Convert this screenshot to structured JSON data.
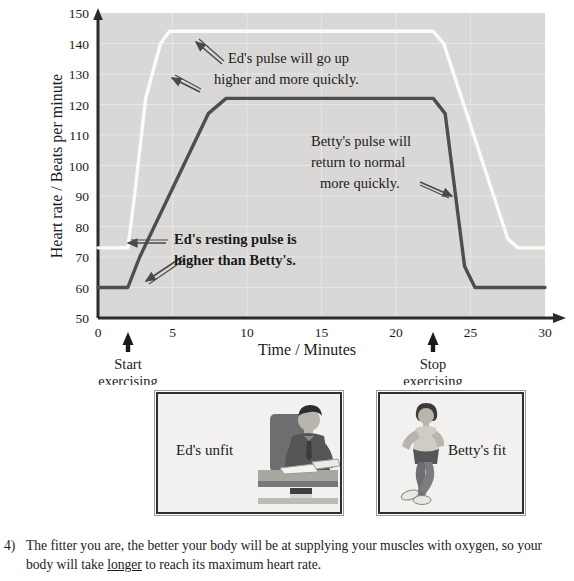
{
  "chart_data": {
    "type": "line",
    "title": "",
    "xlabel": "Time / Minutes",
    "ylabel": "Heart rate / Beats per minute",
    "xlim": [
      0,
      30
    ],
    "ylim": [
      50,
      150
    ],
    "x_ticks": [
      "0",
      "5",
      "10",
      "15",
      "20",
      "25",
      "30"
    ],
    "x_tick_values": [
      0,
      5,
      10,
      15,
      20,
      25,
      30
    ],
    "y_ticks": [
      "50",
      "60",
      "70",
      "80",
      "90",
      "100",
      "110",
      "120",
      "130",
      "140",
      "150"
    ],
    "y_tick_values": [
      50,
      60,
      70,
      80,
      90,
      100,
      110,
      120,
      130,
      140,
      150
    ],
    "grid": true,
    "legend_position": "none",
    "plot_background": "#d9d8d6",
    "series": [
      {
        "name": "Ed",
        "color": "#fbfbf9",
        "description": "Ed's pulse: resting 73, rises fast to peak 144, returns slowly",
        "x": [
          0,
          2,
          2.4,
          3.2,
          4.2,
          4.8,
          22.5,
          23.2,
          27.5,
          28.2,
          30
        ],
        "values": [
          73,
          73,
          88,
          122,
          140,
          144,
          144,
          140,
          76,
          73,
          73
        ]
      },
      {
        "name": "Betty",
        "color": "#4e4e52",
        "description": "Betty's pulse: resting 60, rises slowly to peak 122, returns quickly",
        "x": [
          0,
          2,
          2.8,
          7.4,
          8.6,
          22.5,
          23.3,
          24.6,
          25.3,
          30
        ],
        "values": [
          60,
          60,
          70,
          117,
          122,
          122,
          117,
          67,
          60,
          60
        ]
      }
    ],
    "markers": [
      {
        "name": "start-exercising",
        "x_value": 2,
        "label_line1": "Start",
        "label_line2": "exercising"
      },
      {
        "name": "stop-exercising",
        "x_value": 22.5,
        "label_line1": "Stop",
        "label_line2": "exercising"
      }
    ],
    "annotations": [
      {
        "name": "ed-pulse-annotation",
        "lines": [
          "Ed's pulse will go up",
          "higher and more quickly."
        ],
        "arrows": 2
      },
      {
        "name": "betty-pulse-annotation",
        "lines": [
          "Betty's pulse will",
          "return to normal",
          "more quickly."
        ],
        "arrows": 1
      },
      {
        "name": "ed-resting-annotation",
        "lines": [
          "Ed's resting pulse is",
          "higher than Betty's."
        ],
        "arrows": 2
      }
    ]
  },
  "panels": [
    {
      "name": "ed-unfit-panel",
      "caption": "Ed's unfit",
      "art": "man-at-desk"
    },
    {
      "name": "betty-fit-panel",
      "caption": "Betty's fit",
      "art": "woman-running"
    }
  ],
  "footnote": {
    "marker": "4)",
    "text_before": "The fitter you are, the better your body will be at supplying your muscles with oxygen, so your body will take ",
    "emphasis": "longer",
    "text_after": " to reach its maximum heart rate."
  }
}
